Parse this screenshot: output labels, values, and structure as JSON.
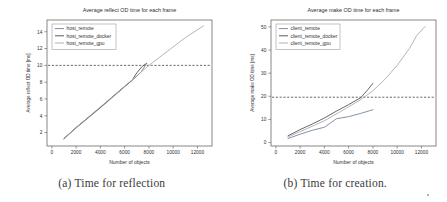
{
  "figure": {
    "subfigures": [
      {
        "caption": "(a) Time for reflection",
        "chart_key": "reflect"
      },
      {
        "caption": "(b) Time for creation.",
        "chart_key": "make"
      }
    ]
  },
  "chart_data": [
    {
      "type": "line",
      "title": "Average reflect OD time for each frame",
      "xlabel": "Number of objects",
      "ylabel": "Average reflect OD time [ms]",
      "xlim": [
        -400,
        13200
      ],
      "ylim": [
        0.4,
        15.4
      ],
      "xticks": [
        0,
        2000,
        4000,
        6000,
        8000,
        10000,
        12000
      ],
      "xticklabels": [
        "0",
        "2000",
        "4000",
        "6000",
        "8000",
        "10000",
        "12000"
      ],
      "yticks": [
        2,
        4,
        6,
        8,
        10,
        12,
        14
      ],
      "yticklabels": [
        "2",
        "4",
        "6",
        "8",
        "10",
        "12",
        "14"
      ],
      "grid": false,
      "legend_position": "upper left",
      "threshold_line": {
        "y": 10.0,
        "style": "dashed",
        "color": "#3a3a3a"
      },
      "series": [
        {
          "name": "host_remote",
          "color": "#6f7f9a",
          "x": [
            1000,
            2000,
            3000,
            4000,
            5000,
            6000,
            7000,
            7400,
            7800
          ],
          "y": [
            1.25,
            2.55,
            3.75,
            4.95,
            6.2,
            7.45,
            8.7,
            9.3,
            10.2
          ]
        },
        {
          "name": "host_remote_docker",
          "color": "#4a4a4a",
          "x": [
            1000,
            2000,
            3000,
            4000,
            5000,
            6000,
            6600,
            7000,
            7400,
            7800
          ],
          "y": [
            1.3,
            2.6,
            3.8,
            5.0,
            6.25,
            7.5,
            8.2,
            9.1,
            9.8,
            10.25
          ]
        },
        {
          "name": "host_remote_gpu",
          "color": "#a8a8a8",
          "x": [
            1000,
            2000,
            4000,
            6000,
            8000,
            10000,
            11000,
            12500
          ],
          "y": [
            1.3,
            2.6,
            5.05,
            7.5,
            10.0,
            12.2,
            13.3,
            14.7
          ]
        }
      ]
    },
    {
      "type": "line",
      "title": "Average make OD time for each frame",
      "xlabel": "Number of objects",
      "ylabel": "Average make OD time [ms]",
      "xlim": [
        -400,
        13200
      ],
      "ylim": [
        -1.5,
        53
      ],
      "xticks": [
        0,
        2000,
        4000,
        6000,
        8000,
        10000,
        12000
      ],
      "xticklabels": [
        "0",
        "2000",
        "4000",
        "6000",
        "8000",
        "10000",
        "12000"
      ],
      "yticks": [
        0,
        10,
        20,
        30,
        40,
        50
      ],
      "yticklabels": [
        "0",
        "10",
        "20",
        "30",
        "40",
        "50"
      ],
      "grid": false,
      "legend_position": "upper left",
      "threshold_line": {
        "y": 19.6,
        "style": "dashed",
        "color": "#3a3a3a"
      },
      "series": [
        {
          "name": "client_remote",
          "color": "#6f7f9a",
          "x": [
            1000,
            2000,
            3000,
            4000,
            5000,
            6000,
            7000,
            8000
          ],
          "y": [
            1.7,
            3.6,
            5.3,
            6.6,
            10.3,
            11.2,
            12.6,
            14.2
          ]
        },
        {
          "name": "client_remote_docker",
          "color": "#4a4a4a",
          "x": [
            1000,
            2000,
            3000,
            4000,
            5000,
            6000,
            7000,
            7600,
            8000
          ],
          "y": [
            2.9,
            5.6,
            8.0,
            10.6,
            13.6,
            16.4,
            19.4,
            23.0,
            25.6
          ]
        },
        {
          "name": "client_remote_gpu",
          "color": "#a8a8a8",
          "x": [
            1000,
            2000,
            4000,
            6000,
            7000,
            8000,
            9000,
            10000,
            11000,
            11600,
            12300
          ],
          "y": [
            2.4,
            4.7,
            9.4,
            15.4,
            18.6,
            22.4,
            27.4,
            33.4,
            40.6,
            46.2,
            50.2
          ]
        }
      ]
    }
  ]
}
